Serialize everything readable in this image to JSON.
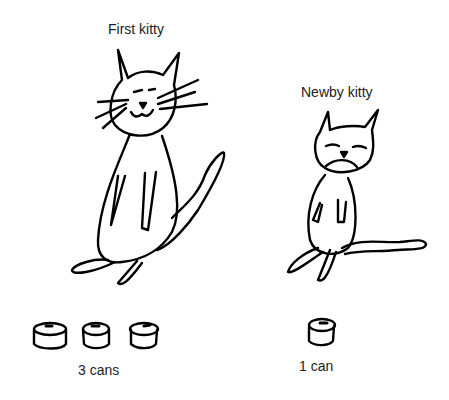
{
  "illustration": {
    "cats": [
      {
        "label": "First kitty",
        "size": "large",
        "expression": "smiling",
        "cans": 3,
        "cans_label": "3 cans"
      },
      {
        "label": "Newby kitty",
        "size": "small",
        "expression": "frowning",
        "cans": 1,
        "cans_label": "1 can"
      }
    ],
    "background": "#ffffff",
    "line_color": "#000000"
  }
}
